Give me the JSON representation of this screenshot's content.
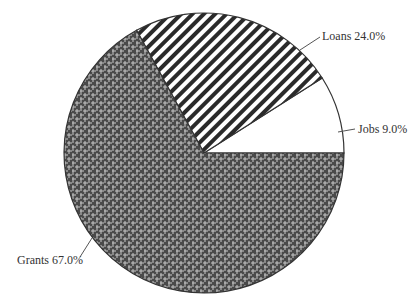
{
  "chart_data": {
    "type": "pie",
    "title": "",
    "categories": [
      "Jobs",
      "Loans",
      "Grants"
    ],
    "values": [
      9.0,
      24.0,
      67.0
    ],
    "units": "%",
    "labels": [
      "Jobs 9.0%",
      "Loans 24.0%",
      "Grants 67.0%"
    ],
    "fills": [
      "solid-white",
      "diagonal-stripes",
      "woven-crosshatch"
    ],
    "start_angle_deg": 0,
    "direction": "counterclockwise",
    "legend": "none (direct labels with leader lines)"
  },
  "labels": {
    "jobs": "Jobs 9.0%",
    "loans": "Loans 24.0%",
    "grants": "Grants 67.0%"
  },
  "colors": {
    "outline": "#333333",
    "stripe": "#2a2a2a",
    "weave_bg": "#555555",
    "weave_fg": "#bbbbbb"
  }
}
